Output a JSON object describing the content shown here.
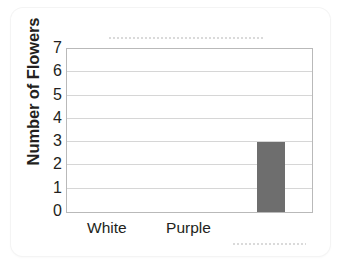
{
  "chart_data": {
    "type": "bar",
    "title": "",
    "xlabel": "",
    "ylabel": "Number of Flowers",
    "categories": [
      "White",
      "Purple",
      ""
    ],
    "values": [
      0,
      0,
      3
    ],
    "ylim": [
      0,
      7
    ],
    "yticks": [
      7,
      6,
      5,
      4,
      3,
      2,
      1,
      0
    ],
    "ytick_labels": [
      "7",
      "6",
      "5",
      "4",
      "3",
      "2",
      "1",
      "0"
    ],
    "xtick_labels": [
      "White",
      "Purple"
    ],
    "grid": true,
    "legend": "none",
    "bar_color": "#6e6e6e",
    "gridline_color": "#d6d6d6",
    "axis_color": "#b9b9b9",
    "text_color": "#231f20",
    "background_color": "#ffffff"
  }
}
